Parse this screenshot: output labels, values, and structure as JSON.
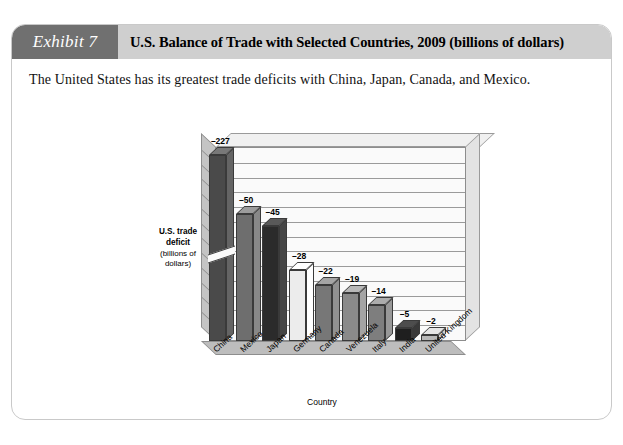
{
  "exhibit": {
    "badge_label": "Exhibit 7",
    "title": "U.S. Balance of Trade with Selected Countries, 2009 (billions of dollars)",
    "caption": "The United States has its greatest trade deficits with China, Japan, Canada, and Mexico."
  },
  "colors": {
    "badge_bg": "#707070",
    "title_bg": "#cfcfcf",
    "card_bg": "#ffffff",
    "card_border": "#c9c9c9",
    "plot_back_wall": "#fafafa",
    "plot_floor": "#bdbdbd",
    "plot_left_wall": "#c4c4c4",
    "gridline": "#9a9a9a"
  },
  "chart_data": {
    "type": "bar",
    "title": "U.S. Balance of Trade with Selected Countries, 2009 (billions of dollars)",
    "xlabel": "Country",
    "ylabel": "U.S. trade deficit (billions of dollars)",
    "ylabel_line1": "U.S. trade",
    "ylabel_line2": "deficit",
    "ylabel_line3": "(billions of",
    "ylabel_line4": "dollars)",
    "grid": true,
    "legend": "none",
    "note": "Bar heights use a broken axis: the China bar is truncated with a break mark.",
    "ylim": [
      0,
      -60
    ],
    "axis_break": true,
    "categories": [
      "China",
      "Mexico",
      "Japan",
      "Germany",
      "Canada",
      "Venezuela",
      "Italy",
      "India",
      "United Kingdom"
    ],
    "values": [
      -227,
      -50,
      -45,
      -28,
      -22,
      -19,
      -14,
      -5,
      -2
    ],
    "labels": [
      "–227",
      "–50",
      "–45",
      "–28",
      "–22",
      "–19",
      "–14",
      "–5",
      "–2"
    ],
    "bar_colors": [
      "#4a4a4a",
      "#6e6e6e",
      "#2b2b2b",
      "#ececec",
      "#777777",
      "#8a8a8a",
      "#7e7e7e",
      "#1f1f1f",
      "#b8b8b8"
    ]
  }
}
